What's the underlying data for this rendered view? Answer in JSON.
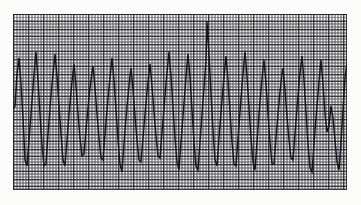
{
  "figure": {
    "kind": "ecg-rhythm-strip",
    "title": "",
    "caption": "",
    "background_color": "#fcfcfb",
    "width_px": 361,
    "height_px": 205
  },
  "paper": {
    "name": "ecg-graph-paper",
    "minor_grid_color": "#5a5a5f",
    "major_grid_color": "#28282d",
    "paper_color": "#fbfbfa",
    "minor_grid_spacing_px": 1.5,
    "major_grid_spacing_px": 7.5,
    "minor_per_major": 5,
    "area": {
      "left": 13,
      "top": 14,
      "width": 334,
      "height": 176
    }
  },
  "trace": {
    "name": "ecg-waveform",
    "color": "#16161a",
    "stroke_width": 1.45,
    "lead_label": "",
    "description": "wide-complex sawtooth rhythm, rapid rate, alternating tall sharp upstrokes and deep downstrokes"
  },
  "chart_data": {
    "type": "line",
    "title": "",
    "xlabel": "",
    "ylabel": "",
    "grid": true,
    "legend": null,
    "xlim": [
      0,
      334
    ],
    "ylim": [
      0,
      176
    ],
    "y_inverted": true,
    "series": [
      {
        "name": "ecg-lead",
        "points": [
          [
            0,
            96
          ],
          [
            2,
            92
          ],
          [
            4,
            60
          ],
          [
            6,
            44
          ],
          [
            8,
            70
          ],
          [
            10,
            104
          ],
          [
            12,
            146
          ],
          [
            14,
            152
          ],
          [
            16,
            126
          ],
          [
            18,
            100
          ],
          [
            20,
            74
          ],
          [
            22,
            48
          ],
          [
            23,
            38
          ],
          [
            25,
            66
          ],
          [
            27,
            100
          ],
          [
            29,
            132
          ],
          [
            31,
            152
          ],
          [
            33,
            150
          ],
          [
            35,
            120
          ],
          [
            37,
            94
          ],
          [
            39,
            70
          ],
          [
            41,
            50
          ],
          [
            42,
            40
          ],
          [
            44,
            62
          ],
          [
            46,
            92
          ],
          [
            48,
            120
          ],
          [
            50,
            146
          ],
          [
            52,
            152
          ],
          [
            54,
            126
          ],
          [
            56,
            100
          ],
          [
            58,
            78
          ],
          [
            60,
            58
          ],
          [
            61,
            50
          ],
          [
            63,
            72
          ],
          [
            65,
            100
          ],
          [
            67,
            124
          ],
          [
            69,
            142
          ],
          [
            71,
            140
          ],
          [
            73,
            116
          ],
          [
            75,
            94
          ],
          [
            77,
            74
          ],
          [
            79,
            58
          ],
          [
            80,
            52
          ],
          [
            82,
            74
          ],
          [
            84,
            100
          ],
          [
            86,
            124
          ],
          [
            88,
            144
          ],
          [
            90,
            146
          ],
          [
            92,
            120
          ],
          [
            94,
            96
          ],
          [
            96,
            74
          ],
          [
            98,
            54
          ],
          [
            99,
            44
          ],
          [
            101,
            66
          ],
          [
            103,
            96
          ],
          [
            105,
            126
          ],
          [
            107,
            150
          ],
          [
            109,
            158
          ],
          [
            111,
            130
          ],
          [
            113,
            104
          ],
          [
            115,
            82
          ],
          [
            117,
            62
          ],
          [
            118,
            54
          ],
          [
            120,
            76
          ],
          [
            122,
            102
          ],
          [
            124,
            126
          ],
          [
            126,
            146
          ],
          [
            128,
            148
          ],
          [
            130,
            124
          ],
          [
            132,
            100
          ],
          [
            134,
            78
          ],
          [
            136,
            58
          ],
          [
            137,
            50
          ],
          [
            139,
            72
          ],
          [
            141,
            98
          ],
          [
            143,
            122
          ],
          [
            145,
            142
          ],
          [
            147,
            144
          ],
          [
            149,
            118
          ],
          [
            151,
            94
          ],
          [
            153,
            70
          ],
          [
            155,
            48
          ],
          [
            156,
            38
          ],
          [
            158,
            62
          ],
          [
            160,
            94
          ],
          [
            162,
            124
          ],
          [
            164,
            148
          ],
          [
            166,
            156
          ],
          [
            168,
            128
          ],
          [
            170,
            102
          ],
          [
            172,
            76
          ],
          [
            174,
            50
          ],
          [
            175,
            40
          ],
          [
            177,
            64
          ],
          [
            179,
            96
          ],
          [
            181,
            128
          ],
          [
            183,
            152
          ],
          [
            185,
            156
          ],
          [
            187,
            128
          ],
          [
            189,
            100
          ],
          [
            191,
            74
          ],
          [
            193,
            46
          ],
          [
            194,
            8
          ],
          [
            196,
            40
          ],
          [
            198,
            80
          ],
          [
            200,
            116
          ],
          [
            202,
            146
          ],
          [
            204,
            152
          ],
          [
            206,
            124
          ],
          [
            208,
            98
          ],
          [
            210,
            74
          ],
          [
            212,
            52
          ],
          [
            213,
            42
          ],
          [
            215,
            66
          ],
          [
            217,
            98
          ],
          [
            219,
            128
          ],
          [
            221,
            150
          ],
          [
            223,
            152
          ],
          [
            225,
            124
          ],
          [
            227,
            98
          ],
          [
            229,
            72
          ],
          [
            231,
            48
          ],
          [
            232,
            38
          ],
          [
            234,
            62
          ],
          [
            236,
            94
          ],
          [
            238,
            124
          ],
          [
            240,
            148
          ],
          [
            242,
            156
          ],
          [
            244,
            128
          ],
          [
            246,
            100
          ],
          [
            248,
            76
          ],
          [
            250,
            54
          ],
          [
            251,
            46
          ],
          [
            253,
            70
          ],
          [
            255,
            100
          ],
          [
            257,
            128
          ],
          [
            259,
            150
          ],
          [
            261,
            150
          ],
          [
            263,
            124
          ],
          [
            265,
            100
          ],
          [
            267,
            78
          ],
          [
            269,
            60
          ],
          [
            270,
            54
          ],
          [
            272,
            76
          ],
          [
            274,
            102
          ],
          [
            276,
            126
          ],
          [
            278,
            144
          ],
          [
            280,
            146
          ],
          [
            282,
            120
          ],
          [
            284,
            94
          ],
          [
            286,
            70
          ],
          [
            288,
            50
          ],
          [
            289,
            42
          ],
          [
            291,
            66
          ],
          [
            293,
            98
          ],
          [
            295,
            130
          ],
          [
            297,
            154
          ],
          [
            299,
            158
          ],
          [
            301,
            130
          ],
          [
            303,
            104
          ],
          [
            305,
            80
          ],
          [
            307,
            56
          ],
          [
            308,
            46
          ],
          [
            310,
            70
          ],
          [
            312,
            100
          ],
          [
            314,
            118
          ],
          [
            316,
            112
          ],
          [
            318,
            92
          ],
          [
            320,
            104
          ],
          [
            322,
            126
          ],
          [
            324,
            148
          ],
          [
            326,
            156
          ],
          [
            328,
            128
          ],
          [
            330,
            96
          ],
          [
            332,
            64
          ],
          [
            334,
            48
          ]
        ]
      }
    ]
  }
}
